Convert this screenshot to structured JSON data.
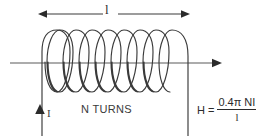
{
  "figure": {
    "stroke_color": "#3a3a3a",
    "text_color": "#2b2b2b",
    "background": "#ffffff"
  },
  "labels": {
    "length": "l",
    "turns": "N TURNS",
    "current": "I"
  },
  "formula": {
    "lhs": "H =",
    "numerator": "0.4π NI",
    "denominator": "l",
    "full": "H = 0.4π NI / l"
  },
  "coil": {
    "turns_drawn": 9,
    "loop_top_y": 30,
    "loop_bottom_y": 92,
    "start_x": 42,
    "end_x": 188
  },
  "axis": {
    "y": 63,
    "start_x": 10,
    "end_x": 222,
    "arrow": "right"
  },
  "dimension_arrow": {
    "y": 14,
    "left_x": 38,
    "right_x": 190,
    "arrows": "both"
  },
  "current_arrow": {
    "x": 40,
    "tip_y": 104,
    "tail_y": 136,
    "direction": "up"
  }
}
